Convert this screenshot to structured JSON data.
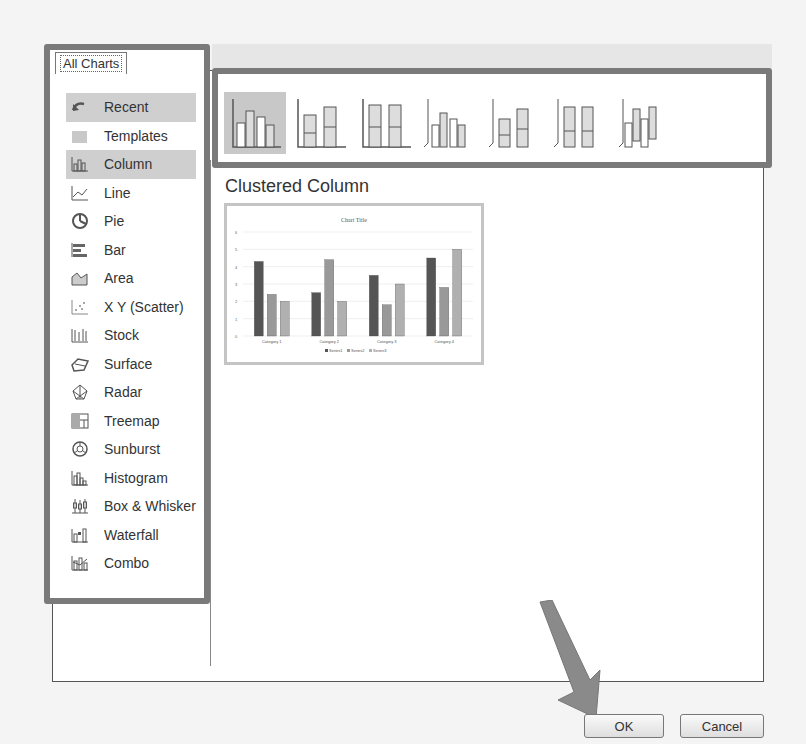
{
  "tab": {
    "label": "All Charts"
  },
  "sidebar": {
    "items": [
      {
        "label": "Recent",
        "icon": "recent-icon",
        "highlighted": true
      },
      {
        "label": "Templates",
        "icon": "templates-icon"
      },
      {
        "label": "Column",
        "icon": "column-chart-icon",
        "selected": true
      },
      {
        "label": "Line",
        "icon": "line-chart-icon"
      },
      {
        "label": "Pie",
        "icon": "pie-chart-icon"
      },
      {
        "label": "Bar",
        "icon": "bar-chart-icon"
      },
      {
        "label": "Area",
        "icon": "area-chart-icon"
      },
      {
        "label": "X Y (Scatter)",
        "icon": "scatter-chart-icon"
      },
      {
        "label": "Stock",
        "icon": "stock-chart-icon"
      },
      {
        "label": "Surface",
        "icon": "surface-chart-icon"
      },
      {
        "label": "Radar",
        "icon": "radar-chart-icon"
      },
      {
        "label": "Treemap",
        "icon": "treemap-chart-icon"
      },
      {
        "label": "Sunburst",
        "icon": "sunburst-chart-icon"
      },
      {
        "label": "Histogram",
        "icon": "histogram-chart-icon"
      },
      {
        "label": "Box & Whisker",
        "icon": "box-whisker-chart-icon"
      },
      {
        "label": "Waterfall",
        "icon": "waterfall-chart-icon"
      },
      {
        "label": "Combo",
        "icon": "combo-chart-icon"
      }
    ]
  },
  "subtypes": [
    {
      "name": "clustered-column",
      "selected": true
    },
    {
      "name": "stacked-column"
    },
    {
      "name": "100-stacked-column"
    },
    {
      "name": "3d-clustered-column"
    },
    {
      "name": "3d-stacked-column"
    },
    {
      "name": "3d-100-stacked-column"
    },
    {
      "name": "3d-column"
    }
  ],
  "main": {
    "heading": "Clustered Column"
  },
  "preview": {
    "title": "Chart Title"
  },
  "buttons": {
    "ok": "OK",
    "cancel": "Cancel"
  },
  "chart_data": {
    "type": "bar",
    "title": "Chart Title",
    "categories": [
      "Category 1",
      "Category 2",
      "Category 3",
      "Category 4"
    ],
    "series": [
      {
        "name": "Series1",
        "values": [
          4.3,
          2.5,
          3.5,
          4.5
        ],
        "color": "#555555"
      },
      {
        "name": "Series2",
        "values": [
          2.4,
          4.4,
          1.8,
          2.8
        ],
        "color": "#999999"
      },
      {
        "name": "Series3",
        "values": [
          2.0,
          2.0,
          3.0,
          5.0
        ],
        "color": "#b0b0b0"
      }
    ],
    "ylim": [
      0,
      6
    ],
    "yticks": [
      0,
      1,
      2,
      3,
      4,
      5,
      6
    ],
    "xlabel": "",
    "ylabel": "",
    "grid": true,
    "legend_position": "bottom"
  }
}
